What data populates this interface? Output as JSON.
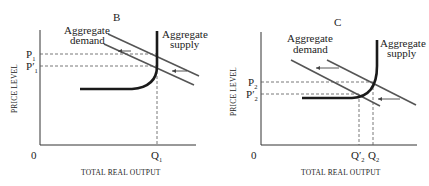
{
  "panels": [
    {
      "id": "B",
      "title": "B",
      "y_axis_label": "PRICE LEVEL",
      "x_axis_label": "TOTAL REAL OUTPUT",
      "origin_label": "0",
      "demand_label_line1": "Aggregate",
      "demand_label_line2": "demand",
      "supply_label_line1": "Aggregate",
      "supply_label_line2": "supply",
      "price_labels": [
        {
          "main": "P",
          "prime": "",
          "sub": "1"
        },
        {
          "main": "P",
          "prime": "′",
          "sub": "1"
        }
      ],
      "quantity_labels": [
        {
          "main": "Q",
          "prime": "",
          "sub": "1"
        }
      ]
    },
    {
      "id": "C",
      "title": "C",
      "y_axis_label": "PRICE LEVEL",
      "x_axis_label": "TOTAL REAL OUTPUT",
      "origin_label": "0",
      "demand_label_line1": "Aggregate",
      "demand_label_line2": "demand",
      "supply_label_line1": "Aggregate",
      "supply_label_line2": "supply",
      "price_labels": [
        {
          "main": "P",
          "prime": "",
          "sub": "2"
        },
        {
          "main": "P",
          "prime": "′",
          "sub": "2"
        }
      ],
      "quantity_labels": [
        {
          "main": "Q",
          "prime": "′",
          "sub": "2"
        },
        {
          "main": "Q",
          "prime": "",
          "sub": "2"
        }
      ]
    }
  ],
  "colors": {
    "axis": "#333333",
    "aggregate_supply": "#1a1a1a",
    "aggregate_demand": "#555555",
    "background": "#ffffff"
  }
}
